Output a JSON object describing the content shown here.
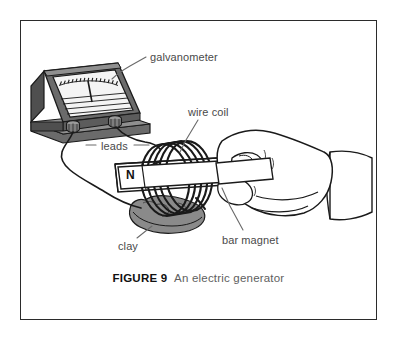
{
  "figure": {
    "caption": {
      "lead": "FIGURE",
      "number": "9",
      "text": "An electric generator"
    },
    "labels": {
      "galvanometer": "galvanometer",
      "wire_coil": "wire coil",
      "leads": "leads",
      "clay": "clay",
      "bar_magnet": "bar magnet",
      "magnet_pole": "N"
    },
    "colors": {
      "frame_border": "#2b2b2b",
      "page_background": "#ffffff",
      "ink": "#1a1a1a",
      "label_text": "#4a4a4a",
      "caption_text": "#5e5e5e",
      "caption_bold": "#111111",
      "meter_body": "#6b6b6b",
      "meter_body_dark": "#4f4f4f",
      "meter_face": "#f2f2f2",
      "clay": "#8a8a8a",
      "magnet_body": "#ffffff",
      "hand_fill": "#ffffff"
    },
    "elements": {
      "galvanometer_name": "galvanometer-device",
      "meter_face_name": "meter-face",
      "meter_needle_name": "meter-needle",
      "terminal_left_name": "terminal-left",
      "terminal_right_name": "terminal-right",
      "lead_wire_upper_name": "lead-wire-upper",
      "lead_wire_lower_name": "lead-wire-lower",
      "coil_name": "wire-coil",
      "magnet_name": "bar-magnet",
      "clay_name": "clay-base",
      "hand_name": "hand-holding-magnet"
    }
  }
}
